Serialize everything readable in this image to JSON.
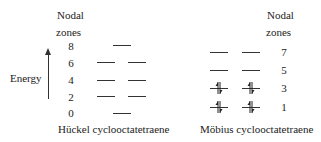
{
  "diagram": {
    "left": {
      "header_line1": "Nodal",
      "header_line2": "zones",
      "axis_label": "Energy",
      "caption": "Hückel cyclooctatetraene",
      "levels": [
        {
          "nodal_zones": "8",
          "orbitals": 1,
          "electrons": 0
        },
        {
          "nodal_zones": "6",
          "orbitals": 2,
          "electrons": 0
        },
        {
          "nodal_zones": "4",
          "orbitals": 2,
          "electrons": 0
        },
        {
          "nodal_zones": "2",
          "orbitals": 2,
          "electrons": 0
        },
        {
          "nodal_zones": "0",
          "orbitals": 1,
          "electrons": 0
        }
      ]
    },
    "right": {
      "header_line1": "Nodal",
      "header_line2": "zones",
      "caption": "Möbius cyclooctatetraene",
      "levels": [
        {
          "nodal_zones": "7",
          "orbitals": 2,
          "electrons": 0
        },
        {
          "nodal_zones": "5",
          "orbitals": 2,
          "electrons": 0
        },
        {
          "nodal_zones": "3",
          "orbitals": 2,
          "electrons": 4
        },
        {
          "nodal_zones": "1",
          "orbitals": 2,
          "electrons": 4
        }
      ]
    }
  }
}
